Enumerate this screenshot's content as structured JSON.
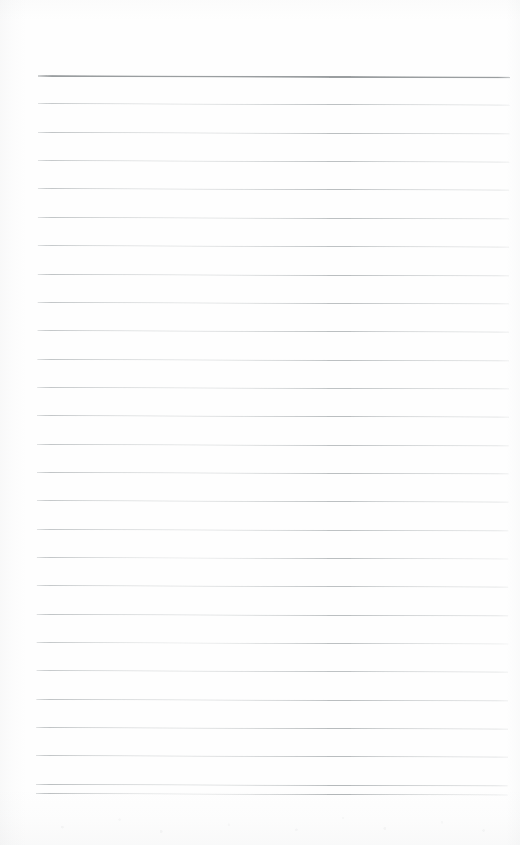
{
  "document": {
    "kind": "scanned-lined-notepad-page",
    "title": "Blank ruled notepad page",
    "orientation": "portrait",
    "width_px": 520,
    "height_px": 845,
    "page_color": "#fefefe",
    "written_content": "",
    "handwriting_present": false,
    "printed_text_present": false
  },
  "ruling": {
    "line_left_x": 38,
    "line_right_x": 510,
    "line_width_px": 472,
    "first_line_y": 75,
    "line_spacing_px": 28.35,
    "total_lines": 27,
    "tilt_degrees": 0.17,
    "header_rule_color": "#9a9ea0",
    "header_rule_thickness_px": 2,
    "body_rule_color": "#bcc0c2",
    "body_rule_thickness_px": 1
  },
  "lines": [
    {
      "index": 0,
      "y": 75.0,
      "color": "#9a9ea0",
      "thickness": 2,
      "role": "header-rule",
      "content": ""
    },
    {
      "index": 1,
      "y": 103.4,
      "color": "#bdc1c3",
      "thickness": 1,
      "role": "body-rule",
      "content": ""
    },
    {
      "index": 2,
      "y": 131.7,
      "color": "#bbbfc1",
      "thickness": 1,
      "role": "body-rule",
      "content": ""
    },
    {
      "index": 3,
      "y": 160.1,
      "color": "#bdc1c3",
      "thickness": 1,
      "role": "body-rule",
      "content": ""
    },
    {
      "index": 4,
      "y": 188.4,
      "color": "#babec0",
      "thickness": 1,
      "role": "body-rule",
      "content": ""
    },
    {
      "index": 5,
      "y": 216.8,
      "color": "#bcc0c2",
      "thickness": 1,
      "role": "body-rule",
      "content": ""
    },
    {
      "index": 6,
      "y": 245.1,
      "color": "#bec2c4",
      "thickness": 1,
      "role": "body-rule",
      "content": ""
    },
    {
      "index": 7,
      "y": 273.5,
      "color": "#babec0",
      "thickness": 1,
      "role": "body-rule",
      "content": ""
    },
    {
      "index": 8,
      "y": 301.8,
      "color": "#bdc1c3",
      "thickness": 1,
      "role": "body-rule",
      "content": ""
    },
    {
      "index": 9,
      "y": 330.2,
      "color": "#bbbfc1",
      "thickness": 1,
      "role": "body-rule",
      "content": ""
    },
    {
      "index": 10,
      "y": 358.5,
      "color": "#bcc0c2",
      "thickness": 1,
      "role": "body-rule",
      "content": ""
    },
    {
      "index": 11,
      "y": 386.9,
      "color": "#bec2c4",
      "thickness": 1,
      "role": "body-rule",
      "content": ""
    },
    {
      "index": 12,
      "y": 415.2,
      "color": "#babec0",
      "thickness": 1,
      "role": "body-rule",
      "content": ""
    },
    {
      "index": 13,
      "y": 443.6,
      "color": "#bdc1c3",
      "thickness": 1,
      "role": "body-rule",
      "content": ""
    },
    {
      "index": 14,
      "y": 471.9,
      "color": "#bbbfc1",
      "thickness": 1,
      "role": "body-rule",
      "content": ""
    },
    {
      "index": 15,
      "y": 500.3,
      "color": "#bcc0c2",
      "thickness": 1,
      "role": "body-rule",
      "content": ""
    },
    {
      "index": 16,
      "y": 528.6,
      "color": "#bec2c4",
      "thickness": 1,
      "role": "body-rule",
      "content": ""
    },
    {
      "index": 17,
      "y": 557.0,
      "color": "#babec0",
      "thickness": 1,
      "role": "body-rule",
      "content": ""
    },
    {
      "index": 18,
      "y": 585.3,
      "color": "#bdc1c3",
      "thickness": 1,
      "role": "body-rule",
      "content": ""
    },
    {
      "index": 19,
      "y": 613.7,
      "color": "#bbbfc1",
      "thickness": 1,
      "role": "body-rule",
      "content": ""
    },
    {
      "index": 20,
      "y": 642.0,
      "color": "#bcc0c2",
      "thickness": 1,
      "role": "body-rule",
      "content": ""
    },
    {
      "index": 21,
      "y": 670.4,
      "color": "#bec2c4",
      "thickness": 1,
      "role": "body-rule",
      "content": ""
    },
    {
      "index": 22,
      "y": 698.7,
      "color": "#babec0",
      "thickness": 1,
      "role": "body-rule",
      "content": ""
    },
    {
      "index": 23,
      "y": 727.1,
      "color": "#b7bbbd",
      "thickness": 1,
      "role": "body-rule",
      "content": ""
    },
    {
      "index": 24,
      "y": 755.4,
      "color": "#b9bdbf",
      "thickness": 1,
      "role": "body-rule",
      "content": ""
    },
    {
      "index": 25,
      "y": 783.8,
      "color": "#b5b9bb",
      "thickness": 1,
      "role": "body-rule",
      "content": ""
    },
    {
      "index": 26,
      "y": 793.0,
      "color": "#b2b6b8",
      "thickness": 1,
      "role": "body-rule-last",
      "content": ""
    }
  ],
  "margins": {
    "top_blank_height_px": 75,
    "bottom_blank_height_px": 52,
    "left_blank_width_px": 38,
    "right_blank_width_px": 10
  },
  "artifacts": {
    "left_edge_shading": true,
    "bottom_edge_shading": true,
    "speckle_band_y": 806,
    "speckle_band_height_px": 34,
    "shading_color": "#969b9e"
  }
}
